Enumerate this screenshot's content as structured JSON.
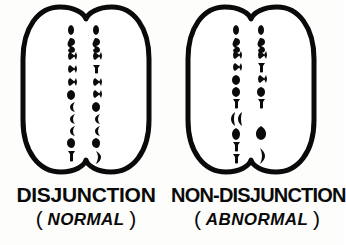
{
  "figure": {
    "title_visible": false,
    "background_color": "#fdfdfb",
    "ink_color": "#0a0a0a",
    "panels": [
      {
        "id": "disjunction",
        "label": "DISJUNCTION",
        "sub_label": "NORMAL",
        "paren_open": "(",
        "paren_close": ")",
        "cell": {
          "name": "dividing-cell-normal",
          "shape": "two-lobed-oval-with-cleavage-furrow",
          "outline_width_px": 5,
          "chromosome_columns": [
            {
              "side": "left",
              "count": 11,
              "x": 73,
              "glyphs": [
                {
                  "y": 30,
                  "type": "rod"
                },
                {
                  "y": 43,
                  "type": "hook"
                },
                {
                  "y": 56,
                  "type": "x-cross"
                },
                {
                  "y": 69,
                  "type": "x-cross"
                },
                {
                  "y": 82,
                  "type": "x-cross"
                },
                {
                  "y": 94,
                  "type": "blob"
                },
                {
                  "y": 106,
                  "type": "curve"
                },
                {
                  "y": 118,
                  "type": "curve"
                },
                {
                  "y": 130,
                  "type": "curve"
                },
                {
                  "y": 142,
                  "type": "blob"
                },
                {
                  "y": 155,
                  "type": "rod"
                }
              ]
            },
            {
              "side": "right",
              "count": 11,
              "x": 98,
              "glyphs": [
                {
                  "y": 30,
                  "type": "rod"
                },
                {
                  "y": 43,
                  "type": "hook"
                },
                {
                  "y": 56,
                  "type": "x-cross"
                },
                {
                  "y": 69,
                  "type": "rod"
                },
                {
                  "y": 82,
                  "type": "x-cross"
                },
                {
                  "y": 94,
                  "type": "x-cross"
                },
                {
                  "y": 106,
                  "type": "blob"
                },
                {
                  "y": 118,
                  "type": "curve"
                },
                {
                  "y": 130,
                  "type": "curve"
                },
                {
                  "y": 142,
                  "type": "blob"
                },
                {
                  "y": 157,
                  "type": "paren-curve"
                }
              ]
            }
          ]
        }
      },
      {
        "id": "non-disjunction",
        "label": "NON-DISJUNCTION",
        "sub_label": "ABNORMAL",
        "paren_open": "(",
        "paren_close": ")",
        "cell": {
          "name": "dividing-cell-abnormal",
          "shape": "two-lobed-oval-with-cleavage-furrow",
          "outline_width_px": 5,
          "chromosome_columns": [
            {
              "side": "left",
              "count": 12,
              "x": 73,
              "glyphs": [
                {
                  "y": 30,
                  "type": "rod"
                },
                {
                  "y": 43,
                  "type": "hook"
                },
                {
                  "y": 56,
                  "type": "x-cross"
                },
                {
                  "y": 68,
                  "type": "x-cross"
                },
                {
                  "y": 80,
                  "type": "blob"
                },
                {
                  "y": 92,
                  "type": "blob"
                },
                {
                  "y": 104,
                  "type": "rod"
                },
                {
                  "y": 116,
                  "type": "double-curve"
                },
                {
                  "y": 130,
                  "type": "blob"
                },
                {
                  "y": 142,
                  "type": "rod"
                },
                {
                  "y": 154,
                  "type": "rod"
                }
              ]
            },
            {
              "side": "right",
              "count": 9,
              "x": 98,
              "glyphs": [
                {
                  "y": 30,
                  "type": "rod"
                },
                {
                  "y": 43,
                  "type": "hook"
                },
                {
                  "y": 56,
                  "type": "x-cross"
                },
                {
                  "y": 68,
                  "type": "rod"
                },
                {
                  "y": 80,
                  "type": "x-cross"
                },
                {
                  "y": 92,
                  "type": "blob"
                },
                {
                  "y": 104,
                  "type": "rod"
                },
                {
                  "y": 130,
                  "type": "blob"
                },
                {
                  "y": 152,
                  "type": "paren-curve"
                }
              ]
            }
          ]
        }
      }
    ]
  }
}
